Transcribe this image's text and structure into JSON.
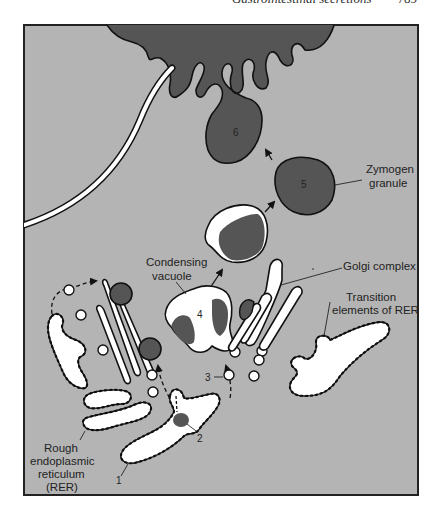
{
  "header": {
    "running_title": "Gastrointestinal secretions",
    "page_number": "789"
  },
  "figure": {
    "colors": {
      "background": "#b4b4b4",
      "dark_fill": "#555555",
      "membrane_fill": "#ffffff",
      "outline": "#111111",
      "frame": "#222222"
    },
    "labels": {
      "zymogen_granule_1": "Zymogen",
      "zymogen_granule_2": "granule",
      "condensing_vacuole_1": "Condensing",
      "condensing_vacuole_2": "vacuole",
      "golgi_complex": "Golgi complex",
      "transition_1": "Transition",
      "transition_2": "elements of RER",
      "rer_1": "Rough",
      "rer_2": "endoplasmic",
      "rer_3": "reticulum",
      "rer_4": "(RER)"
    },
    "step_numbers": {
      "s1": "1",
      "s2": "2",
      "s3": "3",
      "s4": "4",
      "s5": "5",
      "s6": "6"
    }
  }
}
